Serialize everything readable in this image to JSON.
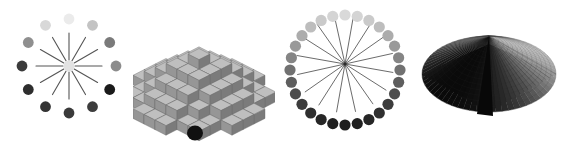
{
  "figure": {
    "width": 562,
    "height": 143,
    "background_color": "#ffffff",
    "panel_count": 4,
    "panels": [
      {
        "id": "radial-dots",
        "name": "Radial spokes with gradient dots",
        "type": "scatter",
        "description": "Twelve radial line spokes emanating from a pale center dot, surrounded by twelve dots whose gray level darkens from right to left",
        "center": {
          "x": 69,
          "y": 66
        },
        "spoke_count": 12,
        "spoke_length": 33,
        "spoke_color": "#555555",
        "spoke_width": 1.1,
        "center_dot": {
          "radius": 5.5,
          "color": "#e2e2e2"
        },
        "ring_radius": 47,
        "dot_radius": 5.4,
        "dots": [
          {
            "angle_deg": 270,
            "color": "#3b3b3b"
          },
          {
            "angle_deg": 300,
            "color": "#8f8f8f"
          },
          {
            "angle_deg": 330,
            "color": "#d8d8d8"
          },
          {
            "angle_deg": 0,
            "color": "#ebebeb"
          },
          {
            "angle_deg": 30,
            "color": "#c3c3c3"
          },
          {
            "angle_deg": 60,
            "color": "#7a7a7a"
          },
          {
            "angle_deg": 90,
            "color": "#8c8c8c"
          },
          {
            "angle_deg": 120,
            "color": "#1a1a1a"
          },
          {
            "angle_deg": 150,
            "color": "#3d3d3d"
          },
          {
            "angle_deg": 180,
            "color": "#3a3a3a"
          },
          {
            "angle_deg": 210,
            "color": "#343434"
          },
          {
            "angle_deg": 240,
            "color": "#2e2e2e"
          }
        ]
      },
      {
        "id": "block-terrain",
        "name": "Stacked cube terrain",
        "type": "surface",
        "description": "Isometric stepped terrain built from shaded cubic blocks, light at the top tiers and progressively darker toward the base, with a small dark sphere at the bottom",
        "tiers": 6,
        "face_colors": {
          "top": "#e8e8e8",
          "left": "#bdbdbd",
          "right": "#9a9a9a",
          "edge": "#6b6b6b"
        },
        "base_sphere_color": "#101010"
      },
      {
        "id": "dot-ring",
        "name": "Dot ring with crossing chords",
        "type": "scatter",
        "description": "A circular ring of twenty-eight dots shading from light gray at the top to near black at the bottom, overlaid by eight thin chords crossing near the center",
        "center": {
          "x": 69,
          "y": 70
        },
        "ring_radius": 55,
        "dot_count": 28,
        "dot_radius": 5.6,
        "dot_color_light": "#d9d9d9",
        "dot_color_dark": "#1e1e1e",
        "chord_count": 8,
        "chord_color": "#5a5a5a",
        "chord_width": 0.9,
        "chord_hub": {
          "x": 69,
          "y": 64
        },
        "hub_dot_color": "#2b2b2b"
      },
      {
        "id": "cone-surface",
        "name": "Shaded cone on square base",
        "type": "surface",
        "description": "A dark mesh-shaded cone rising from a diamond-shaped square base, lit from the upper right so the left flank and base front are nearly black",
        "apex": {
          "x": 73,
          "y": 36
        },
        "base_diamond": {
          "left": {
            "x": 6,
            "y": 74
          },
          "top": {
            "x": 73,
            "y": 44
          },
          "right": {
            "x": 140,
            "y": 74
          },
          "bottom": {
            "x": 73,
            "y": 112
          }
        },
        "mesh_lines": 14,
        "highlight_color": "#b9b9b9",
        "midtone_color": "#6e6e6e",
        "shadow_color": "#0a0a0a",
        "mesh_line_color": "#2a2a2a"
      }
    ]
  }
}
